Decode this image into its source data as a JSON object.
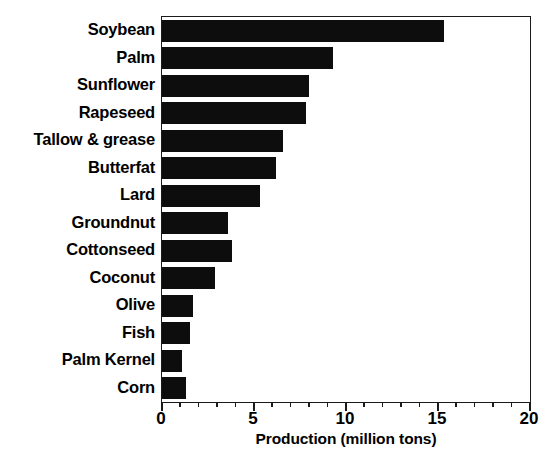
{
  "chart_data": {
    "type": "bar",
    "orientation": "horizontal",
    "title": "",
    "xlabel": "Production (million tons)",
    "ylabel": "",
    "xlim": [
      0,
      20
    ],
    "xticks": [
      0,
      5,
      10,
      15,
      20
    ],
    "xtick_labels": [
      "0",
      "5",
      "10",
      "15",
      "20"
    ],
    "minor_ticks_per_interval": 4,
    "grid": false,
    "legend": false,
    "bar_color": "#0d0d0d",
    "categories": [
      "Soybean",
      "Palm",
      "Sunflower",
      "Rapeseed",
      "Tallow & grease",
      "Butterfat",
      "Lard",
      "Groundnut",
      "Cottonseed",
      "Coconut",
      "Olive",
      "Fish",
      "Palm Kernel",
      "Corn"
    ],
    "values": [
      15.3,
      9.3,
      8.0,
      7.8,
      6.6,
      6.2,
      5.3,
      3.6,
      3.8,
      2.9,
      1.7,
      1.5,
      1.1,
      1.3
    ]
  }
}
